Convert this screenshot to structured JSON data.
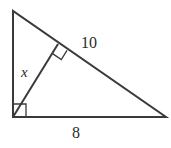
{
  "figure": {
    "kind": "right-triangle-with-altitude",
    "background_color": "#ffffff",
    "stroke_color": "#3a3a3a",
    "text_color": "#2b2b2b",
    "stroke_width": 2,
    "marker_stroke_width": 1.3,
    "vertices": {
      "apex": [
        13,
        11
      ],
      "right_angle_corner": [
        13,
        117
      ],
      "far_right": [
        166,
        117
      ],
      "altitude_foot": [
        58,
        44
      ]
    },
    "labels": {
      "hypotenuse_segment": "10",
      "altitude": "x",
      "base": "8"
    },
    "right_angle_markers": [
      {
        "name": "corner-right-angle",
        "at": [
          13,
          117
        ],
        "size": 13
      },
      {
        "name": "altitude-foot-right-angle",
        "at": [
          58,
          44
        ],
        "size": 11
      }
    ]
  }
}
